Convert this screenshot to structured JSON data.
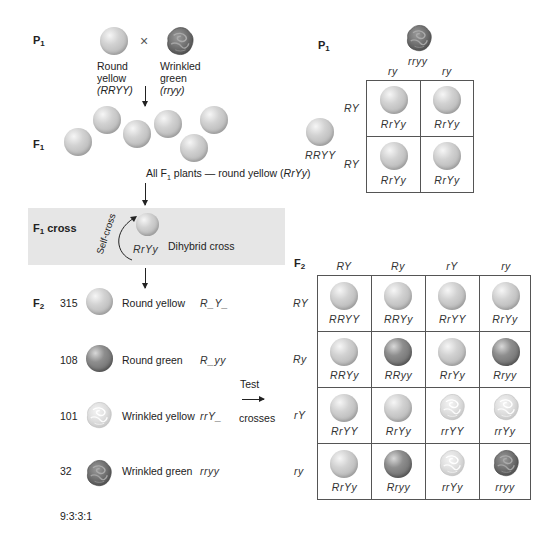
{
  "p1_section": {
    "label_main": "P",
    "label_sub": "1",
    "cross_symbol": "×",
    "parent_yellow": {
      "line1": "Round",
      "line2": "yellow",
      "genotype": "(RRYY)"
    },
    "parent_green": {
      "line1": "Wrinkled",
      "line2": "green",
      "genotype": "(rryy)"
    }
  },
  "f1_section": {
    "label_main": "F",
    "label_sub": "1",
    "caption_prefix": "All F",
    "caption_sub": "1",
    "caption_middle": " plants — round yellow (",
    "caption_genotype": "RrYy",
    "caption_suffix": ")"
  },
  "f1_cross_band": {
    "label_main": "F",
    "label_sub": "1",
    "label_rest": " cross",
    "self_cross_label": "Self-cross",
    "genotype": "RrYy",
    "description": "Dihybrid cross"
  },
  "f2_section": {
    "label_main": "F",
    "label_sub": "2",
    "phenotypes": [
      {
        "count": "315",
        "name": "Round yellow",
        "genotype": "R_Y_",
        "pea": "round-yellow"
      },
      {
        "count": "108",
        "name": "Round green",
        "genotype": "R_yy",
        "pea": "round-green"
      },
      {
        "count": "101",
        "name": "Wrinkled yellow",
        "genotype": "rrY_",
        "pea": "wrinkled-yellow"
      },
      {
        "count": "32",
        "name": "Wrinkled green",
        "genotype": "rryy",
        "pea": "wrinkled-green"
      }
    ],
    "ratio": "9:3:3:1",
    "test_label_top": "Test",
    "test_label_bottom": "crosses"
  },
  "p1_punnett": {
    "label_main": "P",
    "label_sub": "1",
    "top_parent_genotype": "rryy",
    "left_parent_genotype": "RRYY",
    "col_headers": [
      "ry",
      "ry"
    ],
    "row_headers": [
      "RY",
      "RY"
    ],
    "cells": [
      [
        {
          "genotype": "RrYy",
          "pea": "round-yellow"
        },
        {
          "genotype": "RrYy",
          "pea": "round-yellow"
        }
      ],
      [
        {
          "genotype": "RrYy",
          "pea": "round-yellow"
        },
        {
          "genotype": "RrYy",
          "pea": "round-yellow"
        }
      ]
    ]
  },
  "f2_punnett": {
    "label_main": "F",
    "label_sub": "2",
    "col_headers": [
      "RY",
      "Ry",
      "rY",
      "ry"
    ],
    "row_headers": [
      "RY",
      "Ry",
      "rY",
      "ry"
    ],
    "cells": [
      [
        {
          "genotype": "RRYY",
          "pea": "round-yellow"
        },
        {
          "genotype": "RRYy",
          "pea": "round-yellow"
        },
        {
          "genotype": "RrYY",
          "pea": "round-yellow"
        },
        {
          "genotype": "RrYy",
          "pea": "round-yellow"
        }
      ],
      [
        {
          "genotype": "RRYy",
          "pea": "round-yellow"
        },
        {
          "genotype": "RRyy",
          "pea": "round-green"
        },
        {
          "genotype": "RrYy",
          "pea": "round-yellow"
        },
        {
          "genotype": "Rryy",
          "pea": "round-green"
        }
      ],
      [
        {
          "genotype": "RrYY",
          "pea": "round-yellow"
        },
        {
          "genotype": "RrYy",
          "pea": "round-yellow"
        },
        {
          "genotype": "rrYY",
          "pea": "wrinkled-yellow"
        },
        {
          "genotype": "rrYy",
          "pea": "wrinkled-yellow"
        }
      ],
      [
        {
          "genotype": "RrYy",
          "pea": "round-yellow"
        },
        {
          "genotype": "Rryy",
          "pea": "round-green"
        },
        {
          "genotype": "rrYy",
          "pea": "wrinkled-yellow"
        },
        {
          "genotype": "rryy",
          "pea": "wrinkled-green"
        }
      ]
    ]
  },
  "colors": {
    "band": "#e6e6e6",
    "grid": "#555555",
    "round_yellow": "#c8c8c8",
    "round_green": "#777777",
    "wrinkled_yellow": "#e2e2e2",
    "wrinkled_green": "#6e6e6e"
  }
}
